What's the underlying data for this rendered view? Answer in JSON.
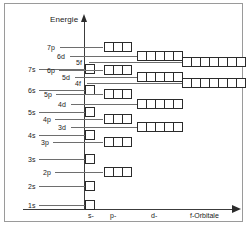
{
  "figure": {
    "title_y_axis": "Energie",
    "columns": [
      {
        "key": "s",
        "label": "s-",
        "x": 81,
        "boxes": 1
      },
      {
        "key": "p",
        "label": "p-",
        "x": 100,
        "boxes": 3
      },
      {
        "key": "d",
        "label": "d-",
        "x": 134,
        "boxes": 5
      },
      {
        "key": "f",
        "label": "f-Orbitale",
        "x": 172,
        "boxes": 7
      }
    ],
    "column_label_x": [
      83,
      105,
      146,
      185
    ],
    "orbitals": [
      {
        "name": "7p",
        "type": "p",
        "boxes": 3,
        "y": 38,
        "label_x": 42,
        "leader_x": 55,
        "leader_w": 43,
        "box_x": 99
      },
      {
        "name": "6d",
        "type": "d",
        "boxes": 5,
        "y": 47,
        "label_x": 52,
        "leader_x": 65,
        "leader_w": 67,
        "box_x": 132
      },
      {
        "name": "5f",
        "type": "f",
        "boxes": 7,
        "y": 53,
        "label_x": 71,
        "leader_x": 84,
        "leader_w": 93,
        "box_x": 177
      },
      {
        "name": "7s",
        "type": "s",
        "boxes": 1,
        "y": 60,
        "label_x": 23,
        "leader_x": 34,
        "leader_w": 46,
        "box_x": 80
      },
      {
        "name": "6p",
        "type": "p",
        "boxes": 3,
        "y": 61,
        "label_x": 42,
        "leader_x": 54,
        "leader_w": 44,
        "box_x": 99
      },
      {
        "name": "5d",
        "type": "d",
        "boxes": 5,
        "y": 68,
        "label_x": 57,
        "leader_x": 70,
        "leader_w": 62,
        "box_x": 132
      },
      {
        "name": "4f",
        "type": "f",
        "boxes": 7,
        "y": 74,
        "label_x": 70,
        "leader_x": 82,
        "leader_w": 95,
        "box_x": 177
      },
      {
        "name": "6s",
        "type": "s",
        "boxes": 1,
        "y": 81,
        "label_x": 23,
        "leader_x": 34,
        "leader_w": 46,
        "box_x": 80
      },
      {
        "name": "5p",
        "type": "p",
        "boxes": 3,
        "y": 85,
        "label_x": 39,
        "leader_x": 51,
        "leader_w": 47,
        "box_x": 99
      },
      {
        "name": "4d",
        "type": "d",
        "boxes": 5,
        "y": 95,
        "label_x": 53,
        "leader_x": 66,
        "leader_w": 66,
        "box_x": 132
      },
      {
        "name": "5s",
        "type": "s",
        "boxes": 1,
        "y": 103,
        "label_x": 23,
        "leader_x": 34,
        "leader_w": 46,
        "box_x": 80
      },
      {
        "name": "4p",
        "type": "p",
        "boxes": 3,
        "y": 110,
        "label_x": 38,
        "leader_x": 50,
        "leader_w": 48,
        "box_x": 99
      },
      {
        "name": "3d",
        "type": "d",
        "boxes": 5,
        "y": 118,
        "label_x": 53,
        "leader_x": 66,
        "leader_w": 66,
        "box_x": 132
      },
      {
        "name": "4s",
        "type": "s",
        "boxes": 1,
        "y": 126,
        "label_x": 23,
        "leader_x": 34,
        "leader_w": 46,
        "box_x": 80
      },
      {
        "name": "3p",
        "type": "p",
        "boxes": 3,
        "y": 133,
        "label_x": 36,
        "leader_x": 48,
        "leader_w": 50,
        "box_x": 99
      },
      {
        "name": "3s",
        "type": "s",
        "boxes": 1,
        "y": 150,
        "label_x": 23,
        "leader_x": 34,
        "leader_w": 46,
        "box_x": 80
      },
      {
        "name": "2p",
        "type": "p",
        "boxes": 3,
        "y": 163,
        "label_x": 38,
        "leader_x": 50,
        "leader_w": 48,
        "box_x": 99
      },
      {
        "name": "2s",
        "type": "s",
        "boxes": 1,
        "y": 177,
        "label_x": 23,
        "leader_x": 34,
        "leader_w": 46,
        "box_x": 80
      },
      {
        "name": "1s",
        "type": "s",
        "boxes": 1,
        "y": 196,
        "label_x": 23,
        "leader_x": 34,
        "leader_w": 46,
        "box_x": 80
      }
    ]
  },
  "chart_data": {
    "type": "diagram",
    "ylabel": "Energie",
    "xlabel": "f-Orbitale",
    "x_categories": [
      "s-",
      "p-",
      "d-",
      "f-Orbitale"
    ],
    "boxes_per_type": {
      "s": 1,
      "p": 3,
      "d": 5,
      "f": 7
    },
    "grid": false,
    "legend": "none",
    "annotations": [
      "Energie",
      "s-",
      "p-",
      "d-",
      "f-Orbitale"
    ],
    "series": [
      {
        "name": "Orbital energy order (low to high)",
        "points": [
          {
            "orbital": "1s",
            "type": "s",
            "boxes": 1,
            "energy_rank": 1
          },
          {
            "orbital": "2s",
            "type": "s",
            "boxes": 1,
            "energy_rank": 2
          },
          {
            "orbital": "2p",
            "type": "p",
            "boxes": 3,
            "energy_rank": 3
          },
          {
            "orbital": "3s",
            "type": "s",
            "boxes": 1,
            "energy_rank": 4
          },
          {
            "orbital": "3p",
            "type": "p",
            "boxes": 3,
            "energy_rank": 5
          },
          {
            "orbital": "4s",
            "type": "s",
            "boxes": 1,
            "energy_rank": 6
          },
          {
            "orbital": "3d",
            "type": "d",
            "boxes": 5,
            "energy_rank": 7
          },
          {
            "orbital": "4p",
            "type": "p",
            "boxes": 3,
            "energy_rank": 8
          },
          {
            "orbital": "5s",
            "type": "s",
            "boxes": 1,
            "energy_rank": 9
          },
          {
            "orbital": "4d",
            "type": "d",
            "boxes": 5,
            "energy_rank": 10
          },
          {
            "orbital": "5p",
            "type": "p",
            "boxes": 3,
            "energy_rank": 11
          },
          {
            "orbital": "6s",
            "type": "s",
            "boxes": 1,
            "energy_rank": 12
          },
          {
            "orbital": "4f",
            "type": "f",
            "boxes": 7,
            "energy_rank": 13
          },
          {
            "orbital": "5d",
            "type": "d",
            "boxes": 5,
            "energy_rank": 14
          },
          {
            "orbital": "6p",
            "type": "p",
            "boxes": 3,
            "energy_rank": 15
          },
          {
            "orbital": "7s",
            "type": "s",
            "boxes": 1,
            "energy_rank": 16
          },
          {
            "orbital": "5f",
            "type": "f",
            "boxes": 7,
            "energy_rank": 17
          },
          {
            "orbital": "6d",
            "type": "d",
            "boxes": 5,
            "energy_rank": 18
          },
          {
            "orbital": "7p",
            "type": "p",
            "boxes": 3,
            "energy_rank": 19
          }
        ]
      }
    ]
  },
  "colors": {
    "line": "#2b2b2b",
    "leader": "#6e6e6e",
    "frame": "#9a9a9a",
    "text": "#1a1a1a",
    "background": "#ffffff"
  }
}
